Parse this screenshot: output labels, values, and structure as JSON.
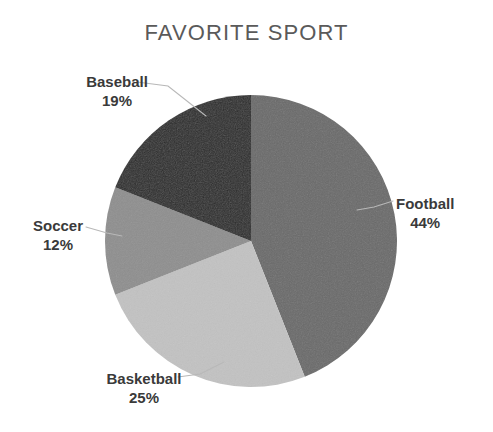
{
  "chart_data": {
    "type": "pie",
    "title": "FAVORITE SPORT",
    "categories": [
      "Football",
      "Basketball",
      "Soccer",
      "Baseball"
    ],
    "values": [
      44,
      25,
      12,
      19
    ],
    "value_unit": "%",
    "start_angle_deg": 0,
    "direction": "clockwise",
    "legend": "none",
    "labels_position": "outside-with-leader-lines",
    "slices": [
      {
        "name": "Football",
        "value": 44,
        "label": "Football",
        "percent_label": "44%",
        "color": "#6a6a6a"
      },
      {
        "name": "Basketball",
        "value": 25,
        "label": "Basketball",
        "percent_label": "25%",
        "color": "#c2c2c2"
      },
      {
        "name": "Soccer",
        "value": 12,
        "label": "Soccer",
        "percent_label": "12%",
        "color": "#8e8e8e"
      },
      {
        "name": "Baseball",
        "value": 19,
        "label": "Baseball",
        "percent_label": "19%",
        "color": "#2b2b2b"
      }
    ]
  },
  "title": {
    "text": "FAVORITE SPORT",
    "color": "#5a5a5a"
  },
  "labels": {
    "football": {
      "name": "Football",
      "pct": "44%"
    },
    "basketball": {
      "name": "Basketball",
      "pct": "25%"
    },
    "soccer": {
      "name": "Soccer",
      "pct": "12%"
    },
    "baseball": {
      "name": "Baseball",
      "pct": "19%"
    }
  },
  "colors": {
    "background": "#ffffff",
    "leader_line": "#b8b8b8",
    "label_text": "#3a3a3a",
    "football": "#6a6a6a",
    "basketball": "#c2c2c2",
    "soccer": "#8e8e8e",
    "baseball": "#2b2b2b"
  }
}
